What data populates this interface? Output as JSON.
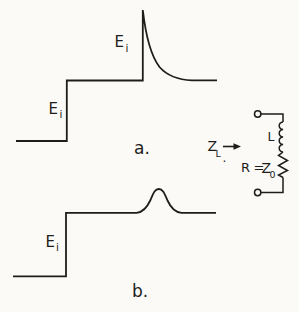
{
  "colors": {
    "ink": "#1d1d1b",
    "paper": "#fbfaf7"
  },
  "figure": {
    "waveform_a": {
      "spike_label": {
        "main": "E",
        "sub": "i"
      },
      "step_label": {
        "main": "E",
        "sub": "i"
      },
      "caption": "a."
    },
    "waveform_b": {
      "step_label": {
        "main": "E",
        "sub": "i"
      },
      "caption": "b."
    },
    "circuit": {
      "impedance_label": {
        "main": "Z",
        "sub": "L",
        "period": "."
      },
      "inductor_label": "L",
      "resistance_label": {
        "prefix": "R =",
        "main": "Z",
        "sub": "0"
      }
    }
  }
}
